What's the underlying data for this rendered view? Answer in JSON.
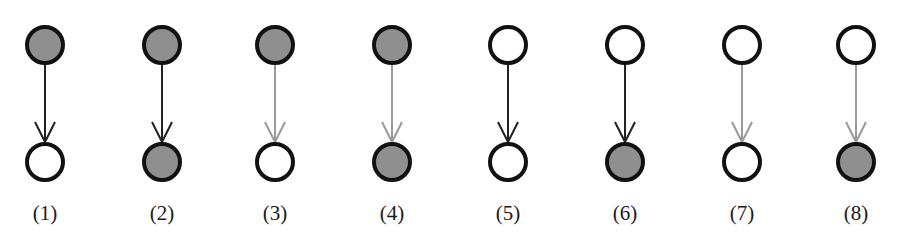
{
  "figure": {
    "colors": {
      "filled_node": "#8f8f8f",
      "empty_node": "#ffffff",
      "node_stroke": "#111111",
      "edge_black": "#222222",
      "edge_gray": "#9a9a9a"
    },
    "layout": {
      "top_y": 45,
      "bottom_y": 162,
      "radius": 18,
      "label_y": 220
    },
    "panels": [
      {
        "id": 1,
        "label": "(1)",
        "x": 45,
        "top_node": "filled",
        "bottom_node": "empty",
        "edge": "black"
      },
      {
        "id": 2,
        "label": "(2)",
        "x": 162,
        "top_node": "filled",
        "bottom_node": "filled",
        "edge": "black"
      },
      {
        "id": 3,
        "label": "(3)",
        "x": 275,
        "top_node": "filled",
        "bottom_node": "empty",
        "edge": "gray"
      },
      {
        "id": 4,
        "label": "(4)",
        "x": 392,
        "top_node": "filled",
        "bottom_node": "filled",
        "edge": "gray"
      },
      {
        "id": 5,
        "label": "(5)",
        "x": 508,
        "top_node": "empty",
        "bottom_node": "empty",
        "edge": "black"
      },
      {
        "id": 6,
        "label": "(6)",
        "x": 625,
        "top_node": "empty",
        "bottom_node": "filled",
        "edge": "black"
      },
      {
        "id": 7,
        "label": "(7)",
        "x": 742,
        "top_node": "empty",
        "bottom_node": "empty",
        "edge": "gray"
      },
      {
        "id": 8,
        "label": "(8)",
        "x": 856,
        "top_node": "empty",
        "bottom_node": "filled",
        "edge": "gray"
      }
    ]
  }
}
